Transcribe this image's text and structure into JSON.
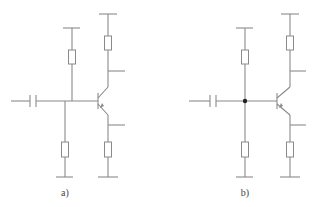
{
  "colors": {
    "wire": "#8a8a8a",
    "junction_dot": "#222222",
    "background": "#ffffff",
    "label": "#444444"
  },
  "circuits": [
    {
      "id": "a",
      "label": "a)",
      "label_pos": [
        65,
        193
      ],
      "has_junction_dot": false,
      "input_x": 11,
      "cap_x": 33,
      "wire_y": 101,
      "bias_top_x": 72,
      "bias_bottom_x": 65,
      "base_x": 98,
      "collector_x": 108,
      "top_rail_y": 14,
      "bias_top_rail_y": 28,
      "ground_y": 177,
      "collector_tap_y": 71,
      "emitter_tap_y": 125,
      "tap_end_x": 125
    },
    {
      "id": "b",
      "label": "b)",
      "label_pos": [
        245,
        193
      ],
      "has_junction_dot": true,
      "input_x": 189,
      "cap_x": 213,
      "wire_y": 101,
      "bias_top_x": 245,
      "bias_bottom_x": 245,
      "base_x": 277,
      "collector_x": 290,
      "top_rail_y": 14,
      "bias_top_rail_y": 28,
      "ground_y": 177,
      "collector_tap_y": 71,
      "emitter_tap_y": 125,
      "tap_end_x": 306
    }
  ]
}
